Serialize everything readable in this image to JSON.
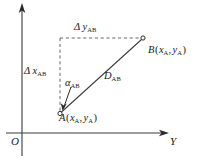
{
  "figure": {
    "kind": "coordinate-geometry-diagram",
    "width": 198,
    "height": 160,
    "background": "#ffffff",
    "line_color": "#3a3a3a",
    "dash_color": "#6a6a6a",
    "text_color": "#1a1a1a"
  },
  "axes": {
    "vertical": {
      "name": "x-axis",
      "x": 22,
      "top_y": 5,
      "bottom_y": 156,
      "arrow": "up"
    },
    "horizontal": {
      "name": "y-axis",
      "y": 133,
      "left_x": 6,
      "right_x": 168,
      "arrow": "right",
      "label": "Y"
    },
    "origin_label": "O"
  },
  "points": {
    "a": {
      "marker_x": 60,
      "marker_y": 113,
      "letter": "A",
      "open_paren": "(",
      "coord_x": "x",
      "coord_x_sub": "A",
      "comma": ",",
      "coord_y": "y",
      "coord_y_sub": "A",
      "close_paren": ")"
    },
    "b": {
      "marker_x": 143,
      "marker_y": 38,
      "letter": "B",
      "open_paren": "(",
      "coord_x": "x",
      "coord_x_sub": "A",
      "comma": ",",
      "coord_y": "y",
      "coord_y_sub": "A",
      "close_paren": ")"
    }
  },
  "segments": {
    "distance": {
      "symbol": "D",
      "subscript": "AB",
      "from": "A",
      "to": "B",
      "style": "solid"
    },
    "delta_y": {
      "symbol": "Δ y",
      "subscript": "AB",
      "style": "dashed",
      "orientation": "horizontal",
      "x1": 60,
      "x2": 143,
      "y": 38
    },
    "delta_x": {
      "symbol": "Δ x",
      "subscript": "AB",
      "style": "dashed",
      "orientation": "vertical",
      "x": 60,
      "y1": 38,
      "y2": 113
    },
    "angle": {
      "symbol": "α",
      "subscript": "AB",
      "vertex": "A"
    }
  }
}
